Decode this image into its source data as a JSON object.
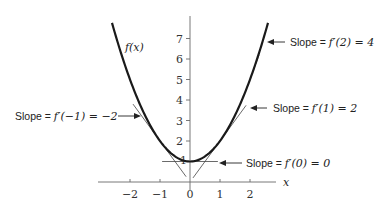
{
  "figure": {
    "function_label": "f(x)",
    "x_axis_label": "x",
    "x_ticks": [
      {
        "value": -2,
        "label": "−2"
      },
      {
        "value": -1,
        "label": "−1"
      },
      {
        "value": 0,
        "label": "0"
      },
      {
        "value": 1,
        "label": "1"
      },
      {
        "value": 2,
        "label": "2"
      }
    ],
    "y_ticks": [
      {
        "value": 1,
        "label": "1"
      },
      {
        "value": 2,
        "label": "2"
      },
      {
        "value": 3,
        "label": "3"
      },
      {
        "value": 4,
        "label": "4"
      },
      {
        "value": 5,
        "label": "5"
      },
      {
        "value": 6,
        "label": "6"
      },
      {
        "value": 7,
        "label": "7"
      }
    ],
    "curve": {
      "formula": "x^2 + 1",
      "x_range": [
        -2.6,
        2.6
      ]
    },
    "tangents": [
      {
        "at_x": -1,
        "slope": -2,
        "x_range": [
          -1.9,
          -0.13
        ],
        "label_prefix": "Slope = ",
        "label_math": "f′(−1) = −2"
      },
      {
        "at_x": 0,
        "slope": 0,
        "x_range": [
          -0.93,
          0.93
        ],
        "label_prefix": "Slope = ",
        "label_math": "f′(0) = 0"
      },
      {
        "at_x": 1,
        "slope": 2,
        "x_range": [
          0.1,
          1.87
        ],
        "label_prefix": "Slope = ",
        "label_math": "f′(1) = 2"
      },
      {
        "at_x": 2,
        "slope": 4,
        "x_range": [
          2.08,
          2.3
        ],
        "label_prefix": "Slope = ",
        "label_math": "f′(2) = 4"
      }
    ],
    "colors": {
      "curve": "#1a1a1a",
      "axis": "#6a6a6a",
      "tangent": "#444444",
      "background": "#ffffff"
    }
  }
}
